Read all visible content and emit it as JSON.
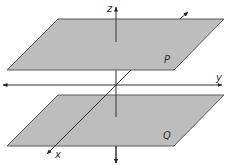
{
  "diagram": {
    "title": "",
    "planes": [
      {
        "id": "P",
        "label": "P",
        "fill": "#bdbdbd",
        "edge": "#5a5a5a"
      },
      {
        "id": "Q",
        "label": "Q",
        "fill": "#bdbdbd",
        "edge": "#5a5a5a"
      }
    ],
    "axes": [
      {
        "id": "z",
        "label": "z"
      },
      {
        "id": "y",
        "label": "y"
      },
      {
        "id": "x",
        "label": "x"
      }
    ],
    "colors": {
      "background": "#ffffff",
      "plane_fill": "#bdbdbd",
      "line": "#333333"
    }
  }
}
